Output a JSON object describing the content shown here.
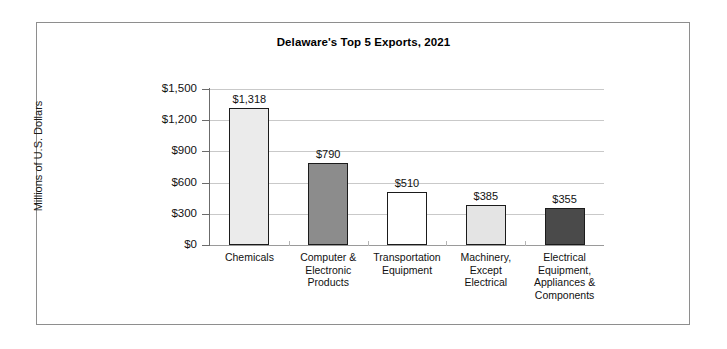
{
  "chart_data": {
    "type": "bar",
    "title": "Delaware's Top 5 Exports, 2021",
    "xlabel": "",
    "ylabel": "Millions of U.S. Dollars",
    "ylim": [
      0,
      1500
    ],
    "ytick_step": 300,
    "grid": true,
    "legend": "none",
    "categories": [
      "Chemicals",
      "Computer & Electronic Products",
      "Transportation Equipment",
      "Machinery, Except Electrical",
      "Electrical Equipment, Appliances & Components"
    ],
    "values": [
      1318,
      790,
      510,
      385,
      355
    ],
    "value_labels": [
      "$1,318",
      "$790",
      "$510",
      "$385",
      "$355"
    ],
    "ytick_labels": [
      "$1,500",
      "$1,200",
      "$900",
      "$600",
      "$300",
      "$0"
    ],
    "ytick_values": [
      1500,
      1200,
      900,
      600,
      300,
      0
    ],
    "bar_colors": [
      "#ebebeb",
      "#8c8c8c",
      "#ffffff",
      "#e4e4e4",
      "#4a4a4a"
    ],
    "bar_border_color": "#1b1b1b",
    "grid_color": "#c9c9c9",
    "axis_color": "#6b6b6b",
    "frame_color": "#8e8e8e",
    "background": "#ffffff"
  },
  "category_lines": [
    [
      "Chemicals"
    ],
    [
      "Computer &",
      "Electronic",
      "Products"
    ],
    [
      "Transportation",
      "Equipment"
    ],
    [
      "Machinery,",
      "Except",
      "Electrical"
    ],
    [
      "Electrical",
      "Equipment,",
      "Appliances &",
      "Components"
    ]
  ]
}
